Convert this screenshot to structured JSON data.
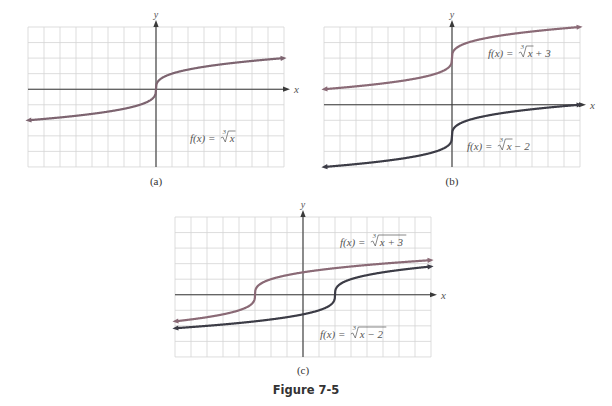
{
  "figure_title": "Figure 7-5",
  "colors": {
    "grid": "#d4d4d4",
    "axis": "#3a3a3a",
    "curve_a": "#7d6470",
    "curve_upper": "#8a6a76",
    "curve_lower": "#3c3c46"
  },
  "chart_data": [
    {
      "type": "line",
      "panel_label": "(a)",
      "xlabel": "x",
      "ylabel": "y",
      "xlim": [
        -8,
        8
      ],
      "ylim": [
        -5,
        4
      ],
      "grid": true,
      "series": [
        {
          "name": "f(x) = ∛x",
          "function": "cbrt(x)",
          "color_key": "curve_a",
          "label_parts": {
            "lhs": "f(x) = ",
            "radicand": "x",
            "index": "3",
            "suffix": ""
          }
        }
      ]
    },
    {
      "type": "line",
      "panel_label": "(b)",
      "xlabel": "x",
      "ylabel": "y",
      "xlim": [
        -8,
        8
      ],
      "ylim": [
        -4,
        5
      ],
      "grid": true,
      "series": [
        {
          "name": "f(x) = ∛x + 3",
          "function": "cbrt(x) + 3",
          "color_key": "curve_upper",
          "label_parts": {
            "lhs": "f(x) = ",
            "radicand": "x",
            "index": "3",
            "suffix": " + 3"
          }
        },
        {
          "name": "f(x) = ∛x − 2",
          "function": "cbrt(x) - 2",
          "color_key": "curve_lower",
          "label_parts": {
            "lhs": "f(x) = ",
            "radicand": "x",
            "index": "3",
            "suffix": " − 2"
          }
        }
      ]
    },
    {
      "type": "line",
      "panel_label": "(c)",
      "xlabel": "x",
      "ylabel": "y",
      "xlim": [
        -8,
        8
      ],
      "ylim": [
        -4,
        5
      ],
      "grid": true,
      "series": [
        {
          "name": "f(x) = ∛(x + 3)",
          "function": "cbrt(x + 3)",
          "color_key": "curve_upper",
          "label_parts": {
            "lhs": "f(x) = ",
            "radicand": "x + 3",
            "index": "3",
            "suffix": ""
          }
        },
        {
          "name": "f(x) = ∛(x − 2)",
          "function": "cbrt(x - 2)",
          "color_key": "curve_lower",
          "label_parts": {
            "lhs": "f(x) = ",
            "radicand": "x − 2",
            "index": "3",
            "suffix": ""
          }
        }
      ]
    }
  ]
}
